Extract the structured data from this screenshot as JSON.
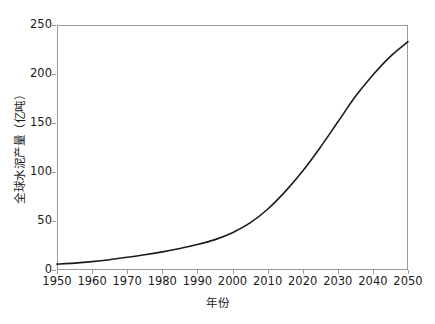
{
  "chart_data": {
    "type": "line",
    "title": "",
    "xlabel": "年份",
    "ylabel": "全球水泥产量（亿吨）",
    "xlim": [
      1950,
      2050
    ],
    "ylim": [
      0,
      250
    ],
    "grid": false,
    "legend": null,
    "x_ticks": [
      1950,
      1960,
      1970,
      1980,
      1990,
      2000,
      2010,
      2020,
      2030,
      2040,
      2050
    ],
    "y_ticks": [
      0,
      50,
      100,
      150,
      200,
      250
    ],
    "x_tick_labels": [
      "1950",
      "1960",
      "1970",
      "1980",
      "1990",
      "2000",
      "2010",
      "2020",
      "2030",
      "2040",
      "2050"
    ],
    "y_tick_labels": [
      "0",
      "50",
      "100",
      "150",
      "200",
      "250"
    ],
    "series": [
      {
        "name": "全球水泥产量",
        "color": "#1c1c1c",
        "line_width": 1.6,
        "x": [
          1950,
          1955,
          1960,
          1965,
          1970,
          1975,
          1980,
          1985,
          1990,
          1995,
          2000,
          2005,
          2010,
          2015,
          2020,
          2025,
          2030,
          2035,
          2040,
          2045,
          2050
        ],
        "values": [
          6,
          7,
          8.5,
          10.5,
          13,
          15.5,
          18.5,
          22,
          26,
          31,
          38,
          48,
          62,
          80,
          101,
          125,
          151,
          177,
          199,
          218,
          233
        ]
      }
    ]
  },
  "axes": {
    "x_title": "年份",
    "y_title": "全球水泥产量（亿吨）"
  },
  "style": {
    "frame_color": "#9a9a9a",
    "curve_color": "#1c1c1c",
    "background": "#ffffff",
    "text_color": "#1a1a1a"
  }
}
